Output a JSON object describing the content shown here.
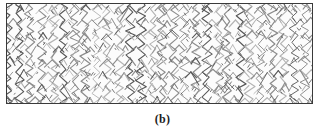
{
  "figure": {
    "caption": "(b)",
    "panel": {
      "border_color": "#3a3a3a",
      "background_color": "#fdfdfd",
      "x": 6,
      "y": 3,
      "width": 307,
      "height": 101
    },
    "texture": {
      "name": "zigzag-chevron-weave-texture",
      "description": "Dense field of near-vertical wavy zigzag strands with chevron branches, resembling a knitted or fibrous textile micrograph",
      "line_color_primary": "#8d8d8d",
      "line_color_accent": "#575757",
      "line_color_light": "#b4b4b4",
      "background_color": "#fcfcfc",
      "column_spacing": 11,
      "row_spacing": 13,
      "columns": 29,
      "rows": 9,
      "stroke_width": 0.9
    }
  }
}
